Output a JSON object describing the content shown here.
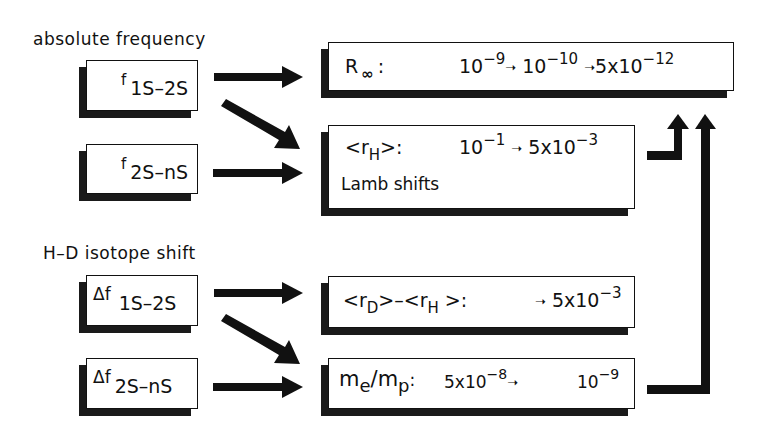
{
  "sections": {
    "absolute": "absolute frequency",
    "isotope": "H–D isotope shift"
  },
  "inputs": [
    {
      "id": "f1s2s",
      "prefix": "f",
      "subscript": "1S–2S"
    },
    {
      "id": "f2sns",
      "prefix": "f",
      "subscript": "2S–nS"
    },
    {
      "id": "df1s2s",
      "prefix": "Δf",
      "subscript": "1S–2S"
    },
    {
      "id": "df2sns",
      "prefix": "Δf",
      "subscript": "2S–nS"
    }
  ],
  "outputs": {
    "rinf": {
      "label_main": "R",
      "label_sub": "∞",
      "colon": ":",
      "v1": "10",
      "v1_exp": "−9",
      "v2": "10",
      "v2_exp": "−10",
      "v3": "5x10",
      "v3_exp": "−12",
      "arrow": "➝"
    },
    "rh": {
      "label_open": "<r",
      "label_sub": "H",
      "label_close": ">:",
      "v1": "10",
      "v1_exp": "−1",
      "v2": "5x10",
      "v2_exp": "−3",
      "arrow": "➝",
      "note": "Lamb shifts"
    },
    "rdrh": {
      "label_a_open": "<r",
      "label_a_sub": "D",
      "label_a_close": ">–",
      "label_b_open": "<r",
      "label_b_sub": "H",
      "label_b_close": " >:",
      "v1": "5x10",
      "v1_exp": "−3",
      "arrow": "➝"
    },
    "memp": {
      "m1": "m",
      "m1_sub": "e",
      "slash": "/",
      "m2": "m",
      "m2_sub": "p",
      "colon": ":",
      "v1": "5x10",
      "v1_exp": "−8",
      "v2": "10",
      "v2_exp": "−9",
      "arrow": "➝"
    }
  },
  "colors": {
    "ink": "#111111",
    "shadow": "#1a1a1a",
    "background": "#ffffff"
  }
}
